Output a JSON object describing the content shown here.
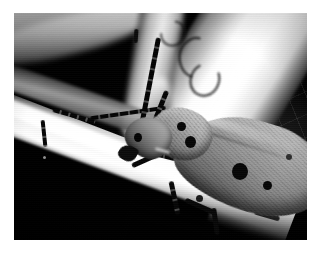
{
  "page": {
    "background_color": "#ffffff",
    "width": 323,
    "height": 257
  },
  "photograph": {
    "subject": "longhorn-beetle",
    "scene_description": "Black and white macro photograph of a long-horned beetle clinging to a pale plant stem",
    "color_mode": "grayscale",
    "frame": {
      "left": 14,
      "top": 13,
      "width": 293,
      "height": 227
    },
    "palette": {
      "background_black": "#060606",
      "stem_white": "#fafafa",
      "stem_midtone": "#a9a9a9",
      "beetle_body": "#8d8d8d",
      "beetle_spot": "#0d0d0d",
      "antenna": "#0c0c0c",
      "page_white": "#ffffff"
    },
    "elements": {
      "beetle_body": "elytra",
      "beetle_thorax": "pronotum",
      "beetle_head": "head",
      "beetle_eye": "eye",
      "antenna_right": "long segmented antenna sweeping up toward top of frame",
      "antenna_left": "long segmented antenna curving left across the stem",
      "main_stem": "bright diagonal stem running lower-left to center-right",
      "upper_right_stem": "bright white blurred stem entering from upper right",
      "upper_left_stem": "blurred pale stem in upper left corner",
      "background": "deep black out-of-focus background with faint web mesh"
    },
    "spot_count": 6,
    "caption": ""
  }
}
